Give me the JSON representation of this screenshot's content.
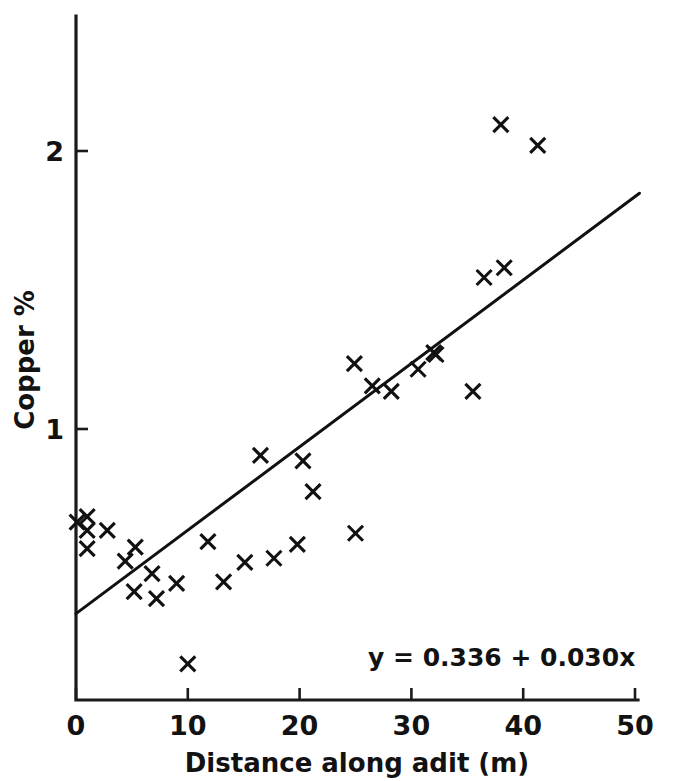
{
  "chart_data": {
    "type": "scatter",
    "title": "",
    "xlabel": "Distance along adit (m)",
    "ylabel": "Copper %",
    "xlim": [
      0,
      50
    ],
    "ylim": [
      0,
      2.35
    ],
    "grid": false,
    "legend": "none",
    "xticks": [
      0,
      10,
      20,
      30,
      40,
      50
    ],
    "xtick_labels": [
      "0",
      "10",
      "20",
      "30",
      "40",
      "50"
    ],
    "yticks": [
      1,
      2
    ],
    "ytick_labels": [
      "1",
      "2"
    ],
    "annotation": "y = 0.336 + 0.030x",
    "series": [
      {
        "name": "Copper assay samples",
        "marker": "x",
        "color": "#111111",
        "points": [
          [
            0.1,
            0.665
          ],
          [
            1.0,
            0.685
          ],
          [
            1.0,
            0.635
          ],
          [
            1.0,
            0.57
          ],
          [
            2.8,
            0.635
          ],
          [
            4.4,
            0.525
          ],
          [
            5.3,
            0.575
          ],
          [
            5.2,
            0.415
          ],
          [
            7.2,
            0.39
          ],
          [
            6.8,
            0.48
          ],
          [
            9.0,
            0.445
          ],
          [
            10.0,
            0.155
          ],
          [
            11.8,
            0.595
          ],
          [
            13.2,
            0.45
          ],
          [
            15.1,
            0.52
          ],
          [
            16.5,
            0.905
          ],
          [
            17.7,
            0.535
          ],
          [
            19.8,
            0.585
          ],
          [
            20.3,
            0.885
          ],
          [
            21.2,
            0.775
          ],
          [
            24.9,
            1.235
          ],
          [
            25.0,
            0.625
          ],
          [
            26.5,
            1.155
          ],
          [
            28.2,
            1.135
          ],
          [
            30.6,
            1.215
          ],
          [
            32.0,
            1.275
          ],
          [
            32.2,
            1.268
          ],
          [
            35.5,
            1.135
          ],
          [
            36.5,
            1.545
          ],
          [
            38.3,
            1.58
          ],
          [
            38.0,
            2.095
          ],
          [
            41.3,
            2.02
          ]
        ]
      }
    ],
    "fit": {
      "name": "least-squares regression line",
      "intercept": 0.336,
      "slope": 0.03,
      "x_start": 0.0,
      "x_end": 50.4
    }
  },
  "axes": {
    "x_axis_name": "distance-axis",
    "y_axis_name": "copper-axis"
  }
}
